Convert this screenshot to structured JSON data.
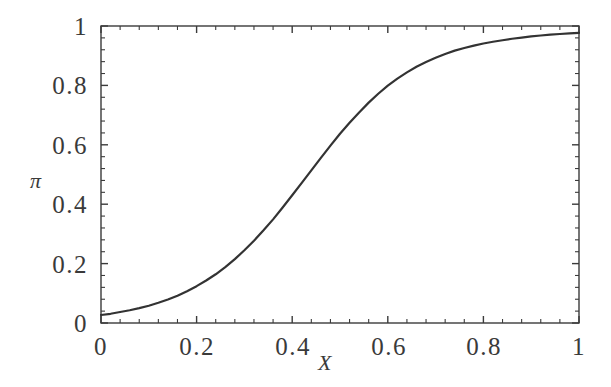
{
  "chart_data": {
    "type": "line",
    "title": "",
    "subtitle": "",
    "xlabel": "X",
    "ylabel": "π",
    "xlim": [
      0,
      1
    ],
    "ylim": [
      0,
      1
    ],
    "grid": false,
    "legend": null,
    "x_ticks": [
      "0",
      "0.2",
      "0.4",
      "0.6",
      "0.8",
      "1"
    ],
    "x_tick_values": [
      0,
      0.2,
      0.4,
      0.6,
      0.8,
      1
    ],
    "y_ticks": [
      "0",
      "0.2",
      "0.4",
      "0.6",
      "0.8",
      "1"
    ],
    "y_tick_values": [
      0,
      0.2,
      0.4,
      0.6,
      0.8,
      1
    ],
    "minor_ticks_per_interval": 4,
    "frame": true,
    "line_color": "#333333",
    "line_width": 2.2,
    "series": [
      {
        "name": "logistic",
        "x": [
          0.0,
          0.02,
          0.04,
          0.06,
          0.08,
          0.1,
          0.12,
          0.14,
          0.16,
          0.18,
          0.2,
          0.22,
          0.24,
          0.26,
          0.28,
          0.3,
          0.32,
          0.34,
          0.36,
          0.38,
          0.4,
          0.42,
          0.44,
          0.46,
          0.48,
          0.5,
          0.52,
          0.54,
          0.56,
          0.58,
          0.6,
          0.62,
          0.64,
          0.66,
          0.68,
          0.7,
          0.72,
          0.74,
          0.76,
          0.78,
          0.8,
          0.82,
          0.84,
          0.86,
          0.88,
          0.9,
          0.92,
          0.94,
          0.96,
          0.98,
          1.0
        ],
        "y": [
          0.027,
          0.031,
          0.037,
          0.043,
          0.05,
          0.058,
          0.068,
          0.079,
          0.092,
          0.107,
          0.124,
          0.143,
          0.164,
          0.188,
          0.215,
          0.245,
          0.277,
          0.312,
          0.349,
          0.389,
          0.43,
          0.472,
          0.514,
          0.556,
          0.597,
          0.637,
          0.674,
          0.709,
          0.742,
          0.772,
          0.799,
          0.823,
          0.844,
          0.863,
          0.879,
          0.893,
          0.906,
          0.917,
          0.926,
          0.934,
          0.941,
          0.947,
          0.952,
          0.957,
          0.961,
          0.965,
          0.968,
          0.971,
          0.973,
          0.975,
          0.977
        ]
      }
    ]
  }
}
